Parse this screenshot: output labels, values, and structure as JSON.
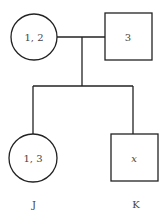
{
  "diagram": {
    "type": "pedigree",
    "parents": {
      "mother": {
        "shape": "circle",
        "label": "1, 2"
      },
      "father": {
        "shape": "square",
        "label": "3"
      }
    },
    "children": [
      {
        "shape": "circle",
        "label": "1, 3",
        "name": "J"
      },
      {
        "shape": "square",
        "label": "x",
        "name": "K"
      }
    ]
  }
}
